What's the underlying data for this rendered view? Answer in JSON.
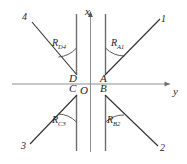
{
  "figure": {
    "type": "coordinate-ray-diagram",
    "axes": {
      "x_label": "x",
      "y_label": "y",
      "origin_label": "O",
      "x_direction": "up",
      "y_direction": "right"
    },
    "points": [
      {
        "id": "A",
        "label": "A",
        "quadrant": "upper-right"
      },
      {
        "id": "B",
        "label": "B",
        "quadrant": "lower-right"
      },
      {
        "id": "C",
        "label": "C",
        "quadrant": "lower-left"
      },
      {
        "id": "D",
        "label": "D",
        "quadrant": "upper-left"
      }
    ],
    "rays": [
      {
        "id": "ray-1",
        "endpoint_label": "1",
        "from": "A",
        "angle_label": "R",
        "angle_sub": "A1"
      },
      {
        "id": "ray-2",
        "endpoint_label": "2",
        "from": "B",
        "angle_label": "R",
        "angle_sub": "B2"
      },
      {
        "id": "ray-3",
        "endpoint_label": "3",
        "from": "C",
        "angle_label": "R",
        "angle_sub": "C3"
      },
      {
        "id": "ray-4",
        "endpoint_label": "4",
        "from": "D",
        "angle_label": "R",
        "angle_sub": "D4"
      }
    ],
    "colors": {
      "line": "#3a3a3a",
      "axis": "#8c8c8c",
      "text": "#1d1d1d"
    }
  }
}
